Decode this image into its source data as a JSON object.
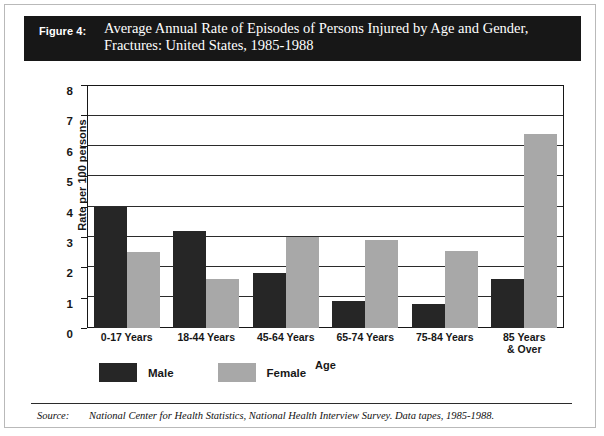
{
  "figure": {
    "number_label": "Figure 4:",
    "title_line1": "Average Annual Rate of Episodes of Persons Injured by Age and Gender,",
    "title_line2": "Fractures:  United States, 1985-1988",
    "banner_color": "#171717"
  },
  "source": {
    "label": "Source:",
    "text": "National Center for Health Statistics, National Health Interview Survey.  Data tapes, 1985-1988."
  },
  "legend": {
    "items": [
      {
        "label": "Male",
        "color": "#262626"
      },
      {
        "label": "Female",
        "color": "#a8a8a8"
      }
    ]
  },
  "chart_data": {
    "type": "bar",
    "title": "Average Annual Rate of Episodes of Persons Injured by Age and Gender, Fractures:  United States, 1985-1988",
    "xlabel": "Age",
    "ylabel": "Rate per 100 persons",
    "ylim": [
      0,
      8
    ],
    "yticks": [
      0,
      1,
      2,
      3,
      4,
      5,
      6,
      7,
      8
    ],
    "ytick_labels": [
      "0",
      "1",
      "2",
      "3",
      "4",
      "5",
      "6",
      "7",
      "8"
    ],
    "grid": true,
    "legend_position": "below-axes-left",
    "categories": [
      "0-17 Years",
      "18-44 Years",
      "45-64 Years",
      "65-74 Years",
      "75-84 Years",
      "85 Years\n& Over"
    ],
    "category_lines": [
      [
        "0-17 Years"
      ],
      [
        "18-44 Years"
      ],
      [
        "45-64 Years"
      ],
      [
        "65-74 Years"
      ],
      [
        "75-84 Years"
      ],
      [
        "85 Years",
        "& Over"
      ]
    ],
    "series": [
      {
        "name": "Male",
        "color": "#262626",
        "values": [
          4.0,
          3.2,
          1.8,
          0.9,
          0.8,
          1.6
        ]
      },
      {
        "name": "Female",
        "color": "#a8a8a8",
        "values": [
          2.5,
          1.6,
          3.0,
          2.9,
          2.55,
          6.4
        ]
      }
    ]
  }
}
